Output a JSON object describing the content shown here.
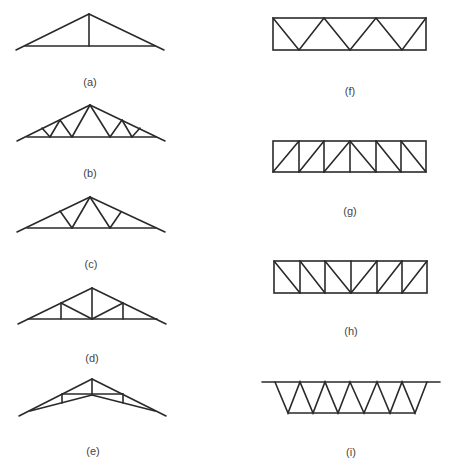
{
  "figure": {
    "colors": {
      "stroke": "#2a2a2a",
      "label": "#444444",
      "background": "#ffffff"
    },
    "trusses": [
      {
        "id": "a",
        "label": "(a)",
        "type": "pitched-kingpost",
        "label_pos": [
          90,
          76
        ]
      },
      {
        "id": "b",
        "label": "(b)",
        "type": "pitched-fink-double",
        "label_pos": [
          90,
          167
        ]
      },
      {
        "id": "c",
        "label": "(c)",
        "type": "pitched-fink",
        "label_pos": [
          91,
          258
        ]
      },
      {
        "id": "d",
        "label": "(d)",
        "type": "pitched-howe",
        "label_pos": [
          92,
          352
        ]
      },
      {
        "id": "e",
        "label": "(e)",
        "type": "scissors",
        "label_pos": [
          93,
          445
        ]
      },
      {
        "id": "f",
        "label": "(f)",
        "type": "flat-warren",
        "label_pos": [
          350,
          85
        ]
      },
      {
        "id": "g",
        "label": "(g)",
        "type": "flat-pratt",
        "label_pos": [
          350,
          205
        ]
      },
      {
        "id": "h",
        "label": "(h)",
        "type": "flat-howe",
        "label_pos": [
          351,
          325
        ]
      },
      {
        "id": "i",
        "label": "(i)",
        "type": "inverted-warren-trapezoid",
        "label_pos": [
          351,
          446
        ]
      }
    ]
  }
}
